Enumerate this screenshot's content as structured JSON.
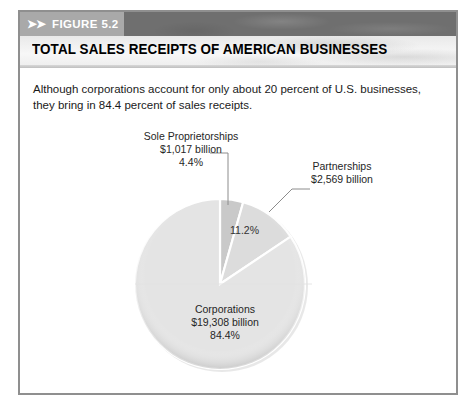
{
  "figure": {
    "chevrons": "➤➤",
    "number": "FIGURE 5.2",
    "title": "TOTAL SALES RECEIPTS OF AMERICAN BUSINESSES",
    "caption": "Although corporations account for only about 20 percent of U.S. businesses, they bring in 84.4 percent of sales receipts."
  },
  "colors": {
    "header_band": "#6f6f6f",
    "figure_tab": "#a9a9a9",
    "frame_border": "#8f8f8f",
    "slice_sole": "#c9c9c9",
    "slice_partnerships": "#dcdcdc",
    "slice_corporations": "#e4e4e4",
    "slice_divider": "#ffffff"
  },
  "chart_data": {
    "type": "pie",
    "title": "TOTAL SALES RECEIPTS OF AMERICAN BUSINESSES",
    "categories": [
      "Sole Proprietorships",
      "Partnerships",
      "Corporations"
    ],
    "values": [
      4.4,
      11.2,
      84.4
    ],
    "unit": "percent",
    "amounts": [
      "$1,017 billion",
      "$2,569 billion",
      "$19,308 billion"
    ],
    "legend": "none",
    "grid": false,
    "slices": [
      {
        "name": "Sole Proprietorships",
        "label_name": "Sole  Proprietorships",
        "amount": "$1,017  billion",
        "percent_label": "4.4%",
        "percent": 4.4,
        "color": "#c9c9c9",
        "label_position": "outside-top",
        "leader_line": true
      },
      {
        "name": "Partnerships",
        "label_name": "Partnerships",
        "amount": "$2,569  billion",
        "percent_label": "11.2%",
        "percent": 11.2,
        "color": "#dcdcdc",
        "label_position": "outside-right",
        "leader_line": true
      },
      {
        "name": "Corporations",
        "label_name": "Corporations",
        "amount": "$19,308  billion",
        "percent_label": "84.4%",
        "percent": 84.4,
        "color": "#e4e4e4",
        "label_position": "inside",
        "leader_line": false
      }
    ]
  }
}
